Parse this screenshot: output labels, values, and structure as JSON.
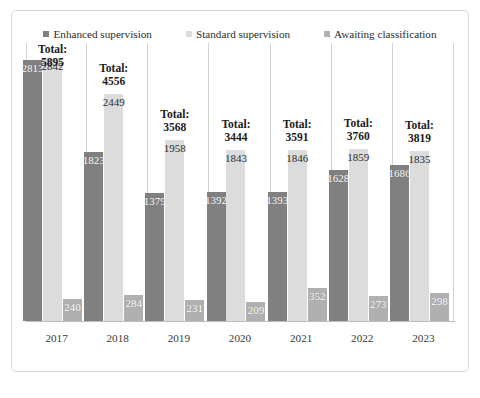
{
  "top_sliver_text": "",
  "frame": {
    "border_color": "#d7d7d7",
    "background": "#ffffff"
  },
  "legend": {
    "position": "top-center",
    "items": [
      {
        "label": "Enhanced supervision",
        "color": "#808080",
        "icon": "square-swatch-icon"
      },
      {
        "label": "Standard supervision",
        "color": "#dcdcdc",
        "icon": "square-swatch-icon"
      },
      {
        "label": "Awaiting classification",
        "color": "#b0b0b0",
        "icon": "square-swatch-icon"
      }
    ]
  },
  "chart_data": {
    "type": "bar",
    "title": "",
    "xlabel": "",
    "ylabel": "",
    "grid": true,
    "legend_position": "top-center",
    "ylim": [
      0,
      3000
    ],
    "categories": [
      "2017",
      "2018",
      "2019",
      "2020",
      "2021",
      "2022",
      "2023"
    ],
    "series": [
      {
        "name": "Enhanced supervision",
        "color": "#808080",
        "values": [
          2813,
          1823,
          1379,
          1392,
          1393,
          1628,
          1686
        ]
      },
      {
        "name": "Standard supervision",
        "color": "#dcdcdc",
        "values": [
          2842,
          2449,
          1958,
          1843,
          1846,
          1859,
          1835
        ]
      },
      {
        "name": "Awaiting classification",
        "color": "#b0b0b0",
        "values": [
          240,
          284,
          231,
          209,
          352,
          273,
          298
        ]
      }
    ],
    "annotations": [
      {
        "category": "2017",
        "text": "Total:\n5895",
        "total": 5895
      },
      {
        "category": "2018",
        "text": "Total:\n4556",
        "total": 4556
      },
      {
        "category": "2019",
        "text": "Total:\n3568",
        "total": 3568
      },
      {
        "category": "2020",
        "text": "Total:\n3444",
        "total": 3444
      },
      {
        "category": "2021",
        "text": "Total:\n3591",
        "total": 3591
      },
      {
        "category": "2022",
        "text": "Total:\n3760",
        "total": 3760
      },
      {
        "category": "2023",
        "text": "Total:\n3819",
        "total": 3819
      }
    ],
    "totals_prefix": "Total:",
    "totals": [
      5895,
      4556,
      3568,
      3444,
      3591,
      3760,
      3819
    ]
  }
}
